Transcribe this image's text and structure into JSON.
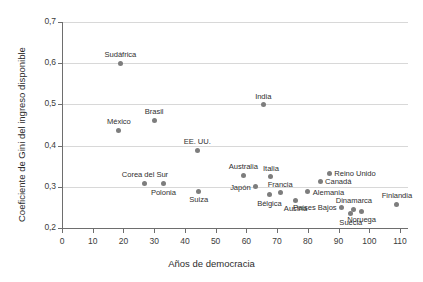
{
  "chart_data": {
    "type": "scatter",
    "title": "",
    "xlabel": "Años de democracia",
    "ylabel": "Coeficiente de Gini del ingreso disponible",
    "xlim": [
      0,
      110
    ],
    "ylim": [
      0.2,
      0.7
    ],
    "grid": "horizontal",
    "legend": "none",
    "marker_color": "#7d7d7d",
    "gridline_color": "#d8d8d8",
    "axis_color": "#6e6e6e",
    "xticks": [
      "0",
      "10",
      "20",
      "30",
      "40",
      "50",
      "60",
      "70",
      "80",
      "90",
      "100",
      "110"
    ],
    "xtick_values": [
      0,
      10,
      20,
      30,
      40,
      50,
      60,
      70,
      80,
      90,
      100,
      110
    ],
    "yticks": [
      "0,2",
      "0,3",
      "0,4",
      "0,5",
      "0,6",
      "0,7"
    ],
    "ytick_values": [
      0.2,
      0.3,
      0.4,
      0.5,
      0.6,
      0.7
    ],
    "points": [
      {
        "label": "Sudáfrica",
        "x": 19,
        "y": 0.6,
        "label_pos": "above"
      },
      {
        "label": "India",
        "x": 65.5,
        "y": 0.499,
        "label_pos": "above"
      },
      {
        "label": "Brasil",
        "x": 30,
        "y": 0.462,
        "label_pos": "above"
      },
      {
        "label": "México",
        "x": 18.5,
        "y": 0.437,
        "label_pos": "above"
      },
      {
        "label": "EE. UU.",
        "x": 44,
        "y": 0.389,
        "label_pos": "above"
      },
      {
        "label": "Reino Unido",
        "x": 87,
        "y": 0.333,
        "label_pos": "right"
      },
      {
        "label": "Australia",
        "x": 59,
        "y": 0.328,
        "label_pos": "above"
      },
      {
        "label": "Italia",
        "x": 68,
        "y": 0.325,
        "label_pos": "above"
      },
      {
        "label": "Canadá",
        "x": 84,
        "y": 0.313,
        "label_pos": "right"
      },
      {
        "label": "Corea del Sur",
        "x": 27,
        "y": 0.309,
        "label_pos": "above"
      },
      {
        "label": "Polonia",
        "x": 33,
        "y": 0.307,
        "label_pos": "below"
      },
      {
        "label": "Japón",
        "x": 63,
        "y": 0.3,
        "label_pos": "left"
      },
      {
        "label": "Suiza",
        "x": 44.5,
        "y": 0.289,
        "label_pos": "below"
      },
      {
        "label": "Alemania",
        "x": 80,
        "y": 0.288,
        "label_pos": "right"
      },
      {
        "label": "Francia",
        "x": 71,
        "y": 0.285,
        "label_pos": "above"
      },
      {
        "label": "Bélgica",
        "x": 67.5,
        "y": 0.281,
        "label_pos": "below"
      },
      {
        "label": "Austria",
        "x": 76,
        "y": 0.267,
        "label_pos": "below"
      },
      {
        "label": "Finlandia",
        "x": 109,
        "y": 0.258,
        "label_pos": "above"
      },
      {
        "label": "Países Bajos",
        "x": 91,
        "y": 0.25,
        "label_pos": "left"
      },
      {
        "label": "Dinamarca",
        "x": 95,
        "y": 0.245,
        "label_pos": "above"
      },
      {
        "label": "Noruega",
        "x": 97.5,
        "y": 0.241,
        "label_pos": "below"
      },
      {
        "label": "Suecia",
        "x": 94,
        "y": 0.234,
        "label_pos": "below"
      }
    ]
  }
}
